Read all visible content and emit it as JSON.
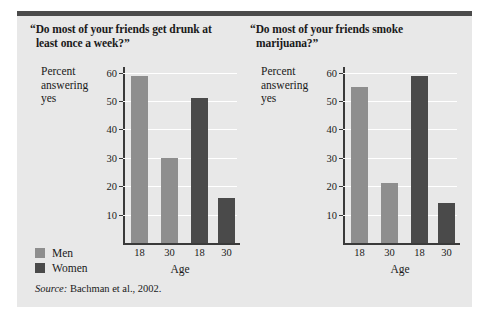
{
  "figure": {
    "source_prefix": "Source:",
    "source_text": " Bachman et al., 2002.",
    "legend": {
      "items": [
        {
          "label": "Men",
          "color": "#8e8e8e"
        },
        {
          "label": "Women",
          "color": "#4a4a4a"
        }
      ]
    }
  },
  "chart_data": [
    {
      "type": "bar",
      "title": "“Do most of your friends get drunk at",
      "title_line2": "least once a week?”",
      "ylabel": "Percent answering yes",
      "ylabel_lines": [
        "Percent",
        "answering",
        "yes"
      ],
      "xlabel": "Age",
      "categories": [
        "18",
        "30",
        "18",
        "30"
      ],
      "series": [
        {
          "name": "Men",
          "color": "#8e8e8e",
          "categories": [
            "18",
            "30"
          ],
          "values": [
            59,
            30
          ]
        },
        {
          "name": "Women",
          "color": "#4a4a4a",
          "categories": [
            "18",
            "30"
          ],
          "values": [
            51,
            16
          ]
        }
      ],
      "values": [
        59,
        30,
        51,
        16
      ],
      "ylim": [
        0,
        62
      ],
      "yticks": [
        10,
        20,
        30,
        40,
        50,
        60
      ],
      "ytick_labels": [
        "10",
        "20",
        "30",
        "40",
        "50",
        "60"
      ],
      "grid": true,
      "legend_position": "bottom-left"
    },
    {
      "type": "bar",
      "title": "“Do most of your friends smoke",
      "title_line2": "marijuana?”",
      "ylabel": "Percent answering yes",
      "ylabel_lines": [
        "Percent",
        "answering",
        "yes"
      ],
      "xlabel": "Age",
      "categories": [
        "18",
        "30",
        "18",
        "30"
      ],
      "series": [
        {
          "name": "Men",
          "color": "#8e8e8e",
          "categories": [
            "18",
            "30"
          ],
          "values": [
            55,
            21
          ]
        },
        {
          "name": "Women",
          "color": "#4a4a4a",
          "categories": [
            "18",
            "30"
          ],
          "values": [
            59,
            14
          ]
        }
      ],
      "values": [
        55,
        21,
        59,
        14
      ],
      "ylim": [
        0,
        62
      ],
      "yticks": [
        10,
        20,
        30,
        40,
        50,
        60
      ],
      "ytick_labels": [
        "10",
        "20",
        "30",
        "40",
        "50",
        "60"
      ],
      "grid": true,
      "legend_position": "none"
    }
  ]
}
